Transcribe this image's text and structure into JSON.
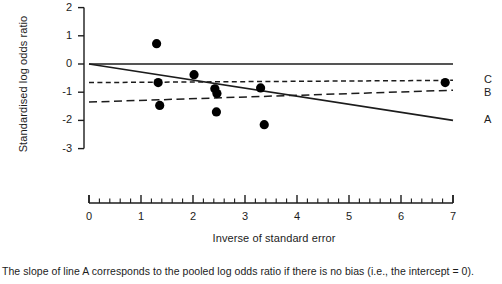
{
  "chart_data": {
    "type": "scatter",
    "title": "",
    "subtitle": "",
    "xlabel": "Inverse of standard error",
    "ylabel": "Standardised log odds ratio",
    "xlim": [
      0,
      7
    ],
    "ylim": [
      -3,
      2
    ],
    "grid": false,
    "legend_position": "right-inline",
    "x_ticks": [
      0,
      1,
      2,
      3,
      4,
      5,
      6,
      7
    ],
    "x_tick_labels": [
      "0",
      "1",
      "2",
      "3",
      "4",
      "5",
      "6",
      "7"
    ],
    "x_minor_tick_interval": 0.2,
    "y_ticks": [
      2,
      1,
      0,
      -1,
      -2,
      -3
    ],
    "y_tick_labels": [
      "2",
      "1",
      "0",
      "-1",
      "-2",
      "-3"
    ],
    "points": [
      {
        "x": 1.3,
        "y": 0.72
      },
      {
        "x": 1.33,
        "y": -0.66
      },
      {
        "x": 1.36,
        "y": -1.47
      },
      {
        "x": 2.02,
        "y": -0.38
      },
      {
        "x": 2.42,
        "y": -0.88
      },
      {
        "x": 2.46,
        "y": -1.05
      },
      {
        "x": 2.45,
        "y": -1.7
      },
      {
        "x": 3.3,
        "y": -0.85
      },
      {
        "x": 3.37,
        "y": -2.15
      },
      {
        "x": 6.85,
        "y": -0.66
      }
    ],
    "lines": [
      {
        "id": "reference",
        "label": "",
        "style": "solid",
        "comment": "horizontal reference at zero",
        "x0": 0.0,
        "y0": 0.0,
        "x1": 7.0,
        "y1": 0.0
      },
      {
        "id": "A",
        "label": "A",
        "style": "solid",
        "comment": "regression through the origin; slope = pooled log odds ratio",
        "x0": 0.0,
        "y0": 0.0,
        "x1": 7.0,
        "y1": -2.0
      },
      {
        "id": "B",
        "label": "B",
        "style": "dashed-long",
        "comment": "lower dashed fitted line",
        "x0": 0.0,
        "y0": -1.35,
        "x1": 7.0,
        "y1": -0.93
      },
      {
        "id": "C",
        "label": "C",
        "style": "dashed-short",
        "comment": "upper dashed fitted line",
        "x0": 0.0,
        "y0": -0.66,
        "x1": 7.0,
        "y1": -0.58
      }
    ],
    "line_tags": [
      {
        "label": "C",
        "value": -0.56
      },
      {
        "label": "B",
        "value": -1.02
      },
      {
        "label": "A",
        "value": -2.0
      }
    ],
    "annotations": [
      "The slope of line A corresponds to the pooled log odds ratio if there is no bias (i.e., the intercept = 0)."
    ]
  },
  "caption": {
    "text": "The slope of line A corresponds to the pooled log odds ratio if there is no bias (i.e., the intercept = 0)."
  },
  "colors": {
    "ink": "#1c1c1c",
    "background": "#ffffff",
    "marker": "#000000"
  }
}
